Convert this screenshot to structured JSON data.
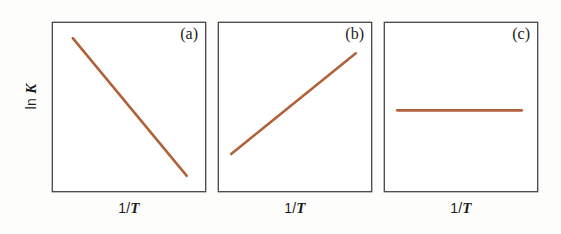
{
  "figure": {
    "background_color": "#fdfdfc",
    "frame_color": "#4d4d50",
    "line_color": "#b0623c",
    "axis_labels": {
      "y_prefix": "ln ",
      "y_variable": "K",
      "x_numerator": "1/",
      "x_variable": "T"
    }
  },
  "chart_data": {
    "type": "line",
    "title": "",
    "subtitle": "",
    "xlabel": "1/T",
    "ylabel": "ln K",
    "grid": false,
    "legend": "none",
    "axis_ticks": {
      "x": [],
      "y": []
    },
    "xlim": [
      0,
      1
    ],
    "ylim": [
      0,
      1
    ],
    "panels": [
      {
        "tag": "(a)",
        "description": "negative slope",
        "series": [
          {
            "name": "ln K vs 1/T",
            "color": "#b0623c",
            "x": [
              0.13,
              0.88
            ],
            "y": [
              0.91,
              0.09
            ]
          }
        ]
      },
      {
        "tag": "(b)",
        "description": "positive slope",
        "series": [
          {
            "name": "ln K vs 1/T",
            "color": "#b0623c",
            "x": [
              0.08,
              0.9
            ],
            "y": [
              0.22,
              0.82
            ]
          }
        ]
      },
      {
        "tag": "(c)",
        "description": "zero slope",
        "series": [
          {
            "name": "ln K vs 1/T",
            "color": "#b0623c",
            "x": [
              0.08,
              0.9
            ],
            "y": [
              0.48,
              0.48
            ]
          }
        ]
      }
    ]
  }
}
